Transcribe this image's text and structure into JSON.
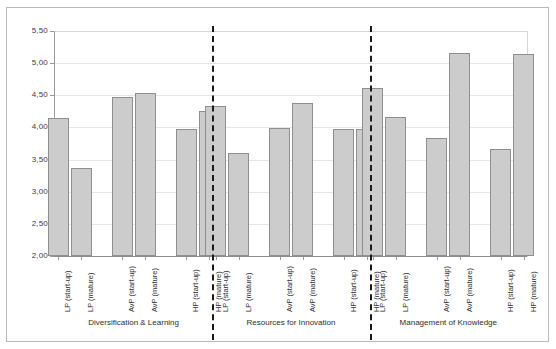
{
  "chart_data": {
    "type": "bar",
    "title": "",
    "subtitle": "",
    "xlabel": "",
    "ylabel": "",
    "ylim": [
      2.0,
      5.5
    ],
    "ytick_labels": [
      "2,00",
      "2,50",
      "3,00",
      "3,50",
      "4,00",
      "4,50",
      "5,00",
      "5,50"
    ],
    "ytick_values": [
      2.0,
      2.5,
      3.0,
      3.5,
      4.0,
      4.5,
      5.0,
      5.5
    ],
    "grid": true,
    "legend": "none",
    "decimal_separator": ",",
    "categories": [
      "LP (start-up)",
      "LP (mature)",
      "AvP (start-up)",
      "AvP (mature)",
      "HP (start-up)",
      "HP (mature)"
    ],
    "groups": [
      {
        "label": "Diversification & Learning",
        "values": [
          4.15,
          3.37,
          4.48,
          4.53,
          3.98,
          4.25
        ]
      },
      {
        "label": "Resources for Innovation",
        "values": [
          4.33,
          3.6,
          3.99,
          4.38,
          3.97,
          3.97
        ]
      },
      {
        "label": "Management of Knowledge",
        "values": [
          4.61,
          4.17,
          3.83,
          5.16,
          3.66,
          5.15
        ]
      }
    ],
    "colors": {
      "bar_fill": "#cccccc",
      "bar_border": "#8f8f8f",
      "gridline": "#e6e6e6",
      "axis": "#8d8d8d",
      "separator": "#1a1a1a",
      "text": "#2e2e2e",
      "background": "#ffffff"
    }
  }
}
